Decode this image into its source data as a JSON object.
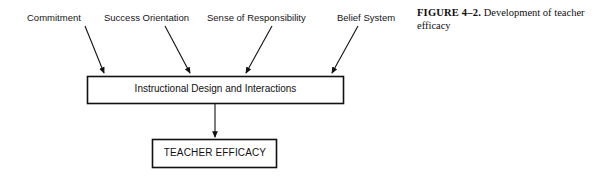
{
  "figure": {
    "caption_number": "FIGURE 4–2.",
    "caption_text": "Development of teacher efficacy"
  },
  "diagram": {
    "type": "flow-diagram",
    "sources": [
      {
        "label": "Commitment",
        "label_x": 27,
        "label_y": 12,
        "arrow": {
          "x1": 85,
          "y1": 26,
          "x2": 104,
          "y2": 74
        }
      },
      {
        "label": "Success Orientation",
        "label_x": 104,
        "label_y": 12,
        "arrow": {
          "x1": 165,
          "y1": 26,
          "x2": 190,
          "y2": 74
        }
      },
      {
        "label": "Sense of Responsibility",
        "label_x": 207,
        "label_y": 12,
        "arrow": {
          "x1": 272,
          "y1": 26,
          "x2": 246,
          "y2": 74
        }
      },
      {
        "label": "Belief System",
        "label_x": 337,
        "label_y": 12,
        "arrow": {
          "x1": 358,
          "y1": 26,
          "x2": 332,
          "y2": 74
        }
      }
    ],
    "boxes": [
      {
        "id": "mid-box",
        "label": "Instructional Design and Interactions",
        "x": 87,
        "y": 76,
        "width": 257,
        "height": 28
      },
      {
        "id": "bottom-box",
        "label": "TEACHER EFFICACY",
        "x": 152,
        "y": 139,
        "width": 125,
        "height": 29
      }
    ],
    "connector": {
      "x1": 215,
      "y1": 104,
      "x2": 215,
      "y2": 138
    },
    "colors": {
      "stroke": "#111111",
      "background": "#ffffff",
      "text": "#111111"
    }
  }
}
